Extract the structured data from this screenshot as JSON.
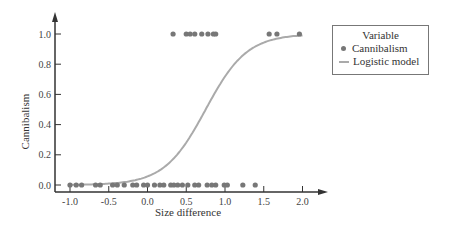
{
  "chart_data": {
    "type": "scatter",
    "title": "",
    "xlabel": "Size difference",
    "ylabel": "Cannibalism",
    "xlim": [
      -1.2,
      2.3
    ],
    "ylim": [
      -0.02,
      1.1
    ],
    "xticks": [
      "-1.0",
      "-0.5",
      "0.0",
      "0.5",
      "1.0",
      "1.5",
      "2.0"
    ],
    "xtick_values": [
      -1.0,
      -0.5,
      0.0,
      0.5,
      1.0,
      1.5,
      2.0
    ],
    "yticks": [
      "0.0",
      "0.2",
      "0.4",
      "0.6",
      "0.8",
      "1.0"
    ],
    "ytick_values": [
      0.0,
      0.2,
      0.4,
      0.6,
      0.8,
      1.0
    ],
    "grid": false,
    "legend": {
      "title": "Variable",
      "position": "upper right, outside plot",
      "entries": [
        {
          "label": "Cannibalism",
          "marker": "dot",
          "color": "#777777"
        },
        {
          "label": "Logistic model",
          "marker": "line",
          "color": "#aaaaaa"
        }
      ]
    },
    "series": [
      {
        "name": "Cannibalism",
        "type": "scatter",
        "color": "#777777",
        "points_y1_x": [
          0.33,
          0.5,
          0.55,
          0.61,
          0.7,
          0.78,
          0.85,
          0.88,
          1.57,
          1.67,
          1.96
        ],
        "points_y0_x": [
          -1.0,
          -0.92,
          -0.85,
          -0.67,
          -0.61,
          -0.45,
          -0.39,
          -0.3,
          -0.19,
          -0.14,
          -0.05,
          0.0,
          0.09,
          0.16,
          0.21,
          0.3,
          0.34,
          0.39,
          0.45,
          0.52,
          0.61,
          0.66,
          0.77,
          0.83,
          0.88,
          0.99,
          1.03,
          1.23,
          1.39
        ]
      },
      {
        "name": "Logistic model",
        "type": "line",
        "color": "#aaaaaa",
        "x": [
          -1.0,
          -0.5,
          0.0,
          0.25,
          0.5,
          0.75,
          1.0,
          1.25,
          1.5,
          1.75,
          2.0
        ],
        "y": [
          0.0,
          0.01,
          0.04,
          0.1,
          0.25,
          0.5,
          0.72,
          0.84,
          0.91,
          0.94,
          0.96
        ]
      }
    ]
  }
}
